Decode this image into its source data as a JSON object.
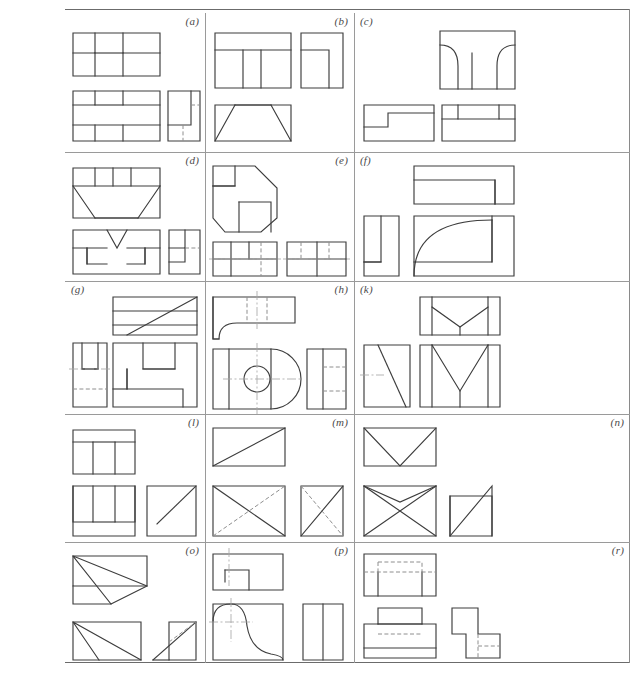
{
  "sheet": {
    "type": "orthographic-projection-exercise-sheet",
    "description": "Technical drawing exercise sheet with 15 problem cells of multiview orthographic projections",
    "grid": {
      "columns": 3,
      "rows": 5,
      "cell_count": 15
    },
    "frame": {
      "top_rule": true,
      "bottom_rule": true,
      "right_rule": true,
      "line_color": "#6b6b6b"
    },
    "style": {
      "visible_line_color": "#3d3d3d",
      "hidden_line_color": "#8e8e8e",
      "center_line_color": "#a8a8a8",
      "background": "#ffffff"
    }
  },
  "cells": [
    {
      "id": "a",
      "label": "(a)",
      "row": 1,
      "col": 1,
      "views": [
        "front-U-block",
        "bottom-T-block",
        "side-stepped-block"
      ],
      "features": [
        "rectangular notch",
        "hidden line"
      ]
    },
    {
      "id": "b",
      "label": "(b)",
      "row": 1,
      "col": 2,
      "views": [
        "front-slot-block",
        "side-L-block",
        "top-trapezoid"
      ],
      "features": [
        "central slot",
        "chamfered trapezoid"
      ]
    },
    {
      "id": "c",
      "label": "(c)",
      "row": 1,
      "col": 3,
      "views": [
        "front-twin-fillet",
        "side-step",
        "top-double-notch"
      ],
      "features": [
        "fillet radii",
        "twin notches"
      ]
    },
    {
      "id": "d",
      "label": "(d)",
      "row": 2,
      "col": 1,
      "views": [
        "top-ribbed-block",
        "front-vee-notch",
        "side-step-block"
      ],
      "features": [
        "V-notch",
        "rib divisions",
        "hidden line"
      ]
    },
    {
      "id": "e",
      "label": "(e)",
      "row": 2,
      "col": 2,
      "views": [
        "front-chamfered-outline",
        "top-slotted",
        "side-slotted"
      ],
      "features": [
        "chamfered corners",
        "hidden lines",
        "center line"
      ]
    },
    {
      "id": "f",
      "label": "(f)",
      "row": 2,
      "col": 3,
      "views": [
        "top-stepped-bar",
        "side-channel",
        "front-quarter-round"
      ],
      "features": [
        "large quarter-circle arc"
      ]
    },
    {
      "id": "g",
      "label": "(g)",
      "row": 3,
      "col": 1,
      "views": [
        "top-inclined-face",
        "front-U-slot",
        "side-stepped"
      ],
      "features": [
        "inclined plane",
        "U-slot",
        "hidden line"
      ]
    },
    {
      "id": "h",
      "label": "(h)",
      "row": 3,
      "col": 2,
      "views": [
        "top-rounded-end",
        "front-with-hole",
        "side-slotted"
      ],
      "features": [
        "through hole",
        "rounded end",
        "center lines",
        "hidden lines"
      ]
    },
    {
      "id": "k",
      "label": "(k)",
      "row": 3,
      "col": 3,
      "views": [
        "top-vee-groove",
        "side-diagonal",
        "front-vee-groove"
      ],
      "features": [
        "V-groove",
        "diagonal face",
        "center line"
      ]
    },
    {
      "id": "l",
      "label": "(l)",
      "row": 4,
      "col": 1,
      "views": [
        "top-T-slot",
        "front-T-slot",
        "side-diagonal"
      ],
      "features": [
        "T-slot",
        "diagonal face"
      ]
    },
    {
      "id": "m",
      "label": "(m)",
      "row": 4,
      "col": 2,
      "views": [
        "top-diagonal",
        "front-crossed",
        "side-crossed"
      ],
      "features": [
        "crossed diagonals",
        "hidden diagonal"
      ]
    },
    {
      "id": "n",
      "label": "(n)",
      "row": 4,
      "col": 3,
      "views": [
        "top-vee",
        "front-crossed-vee",
        "side-triangle"
      ],
      "features": [
        "V-face",
        "crossed lines",
        "triangular face"
      ]
    },
    {
      "id": "o",
      "label": "(o)",
      "row": 5,
      "col": 1,
      "views": [
        "top-fan-triangles",
        "front-fan-triangles",
        "side-triangle"
      ],
      "features": [
        "fan of triangular faces",
        "hidden diagonal"
      ]
    },
    {
      "id": "p",
      "label": "(p)",
      "row": 5,
      "col": 2,
      "views": [
        "top-slot",
        "front-s-curve",
        "side-divided"
      ],
      "features": [
        "ogee S-curve",
        "center lines"
      ]
    },
    {
      "id": "r",
      "label": "(r)",
      "row": 5,
      "col": 3,
      "views": [
        "top-hidden-recess",
        "front-stepped-pedestal",
        "side-z-profile"
      ],
      "features": [
        "hidden recess",
        "stepped pedestal",
        "Z-profile"
      ]
    }
  ]
}
